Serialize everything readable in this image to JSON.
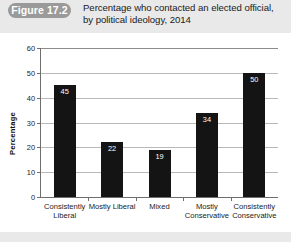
{
  "figure": {
    "badge_label": "Figure 17.2",
    "title": "Percentage who contacted an elected official, by political ideology, 2014"
  },
  "chart_data": {
    "type": "bar",
    "title": "Percentage who contacted an elected official, by political ideology, 2014",
    "categories": [
      "Consistently Liberal",
      "Mostly Liberal",
      "Mixed",
      "Mostly Conservative",
      "Consistently Conservative"
    ],
    "values": [
      45,
      22,
      19,
      34,
      50
    ],
    "xlabel": "",
    "ylabel": "Percentage",
    "ylim": [
      0,
      60
    ],
    "yticks": [
      0,
      10,
      20,
      30,
      40,
      50,
      60
    ],
    "grid": true,
    "legend": false,
    "bar_color": "#141414",
    "value_label_color": "#ffffff"
  },
  "colors": {
    "page_background": "#e9e9e9",
    "panel_background": "#ffffff",
    "badge_background": "#9a9a9a",
    "axis": "#6e6e6e",
    "gridline": "#b9b9b9"
  }
}
